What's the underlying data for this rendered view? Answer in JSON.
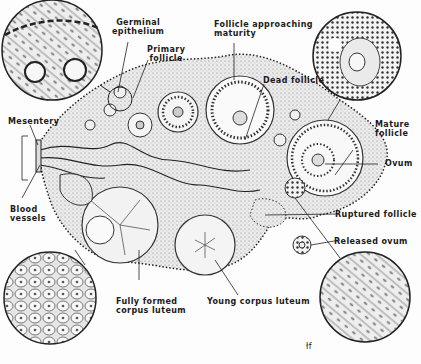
{
  "diagram": {
    "labels": {
      "germinal_epithelium": "Germinal\nepithelium",
      "primary_follicle": "Primary\nfollicle",
      "follicle_approaching_maturity": "Follicle approaching\nmaturity",
      "dead_follicle": "Dead follicle",
      "mesentery": "Mesentery",
      "blood_vessels": "Blood\nvessels",
      "mature_follicle": "Mature\nfollicle",
      "ovum": "Ovum",
      "ruptured_follicle": "Ruptured follicle",
      "released_ovum": "Released ovum",
      "fully_formed_corpus_luteum": "Fully formed\ncorpus luteum",
      "young_corpus_luteum": "Young corpus luteum"
    },
    "signature": "łf",
    "colors": {
      "ink": "#1b1b1b",
      "tissue": "#d9d9d9",
      "background": "#fdfdfd"
    }
  }
}
